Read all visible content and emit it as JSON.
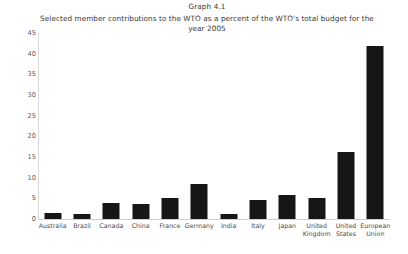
{
  "chart_data": {
    "type": "bar",
    "title": "Graph 4.1",
    "subtitle": "Selected member contributions to the WTO as a percent of the WTO's total budget for the year 2005",
    "xlabel": "",
    "ylabel": "",
    "ylim": [
      0,
      45
    ],
    "yticks": [
      0,
      5,
      10,
      15,
      20,
      25,
      30,
      35,
      40,
      45
    ],
    "grid": false,
    "legend": false,
    "bar_color": "#161616",
    "categories": [
      "Australia",
      "Brazil",
      "Canada",
      "China",
      "France",
      "Germany",
      "India",
      "Italy",
      "Japan",
      "United Kingdom",
      "United States",
      "European Union"
    ],
    "values": [
      1.5,
      1.2,
      3.9,
      3.6,
      5.2,
      8.4,
      1.1,
      4.5,
      5.9,
      5.2,
      16.2,
      41.8
    ]
  }
}
